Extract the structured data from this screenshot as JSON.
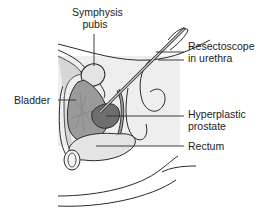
{
  "diagram": {
    "type": "anatomical-illustration",
    "style": "grayscale line art",
    "labels": {
      "symphysis_pubis": {
        "line1": "Symphysis",
        "line2": "pubis"
      },
      "resectoscope": {
        "line1": "Resectoscope",
        "line2": "in urethra"
      },
      "bladder": {
        "line1": "Bladder"
      },
      "hyperplastic_prostate": {
        "line1": "Hyperplastic",
        "line2": "prostate"
      },
      "rectum": {
        "line1": "Rectum"
      }
    },
    "colors": {
      "background": "#ffffff",
      "shade_panel": "#eeeeee",
      "line": "#2a2a2a",
      "bladder_fill": "#9a9a9a",
      "prostate_fill": "#6e6e6e",
      "bone_fill": "#e4e4e4",
      "tissue_fill": "#d6d6d6"
    }
  }
}
